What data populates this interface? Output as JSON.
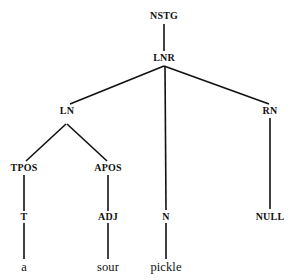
{
  "figure": {
    "kind": "linguistic-parse-tree",
    "sentence": "a sour pickle",
    "background_color": "#ffffff",
    "line_color": "#111111",
    "text_color": "#111111"
  },
  "nodes": [
    {
      "id": "nstg",
      "label": "NSTG",
      "kind": "category",
      "x": 164,
      "y": 16
    },
    {
      "id": "lnr",
      "label": "LNR",
      "kind": "category",
      "x": 164,
      "y": 58
    },
    {
      "id": "ln",
      "label": "LN",
      "kind": "category",
      "x": 67,
      "y": 111
    },
    {
      "id": "rn",
      "label": "RN",
      "kind": "category",
      "x": 270,
      "y": 111
    },
    {
      "id": "tpos",
      "label": "TPOS",
      "kind": "category",
      "x": 24,
      "y": 168
    },
    {
      "id": "apos",
      "label": "APOS",
      "kind": "category",
      "x": 108,
      "y": 168
    },
    {
      "id": "t",
      "label": "T",
      "kind": "category",
      "x": 24,
      "y": 217
    },
    {
      "id": "adj",
      "label": "ADJ",
      "kind": "category",
      "x": 108,
      "y": 217
    },
    {
      "id": "n",
      "label": "N",
      "kind": "category",
      "x": 166,
      "y": 217
    },
    {
      "id": "null",
      "label": "NULL",
      "kind": "category",
      "x": 270,
      "y": 217
    },
    {
      "id": "word_a",
      "label": "a",
      "kind": "word",
      "x": 24,
      "y": 267
    },
    {
      "id": "word_sour",
      "label": "sour",
      "kind": "word",
      "x": 108,
      "y": 267
    },
    {
      "id": "word_pickle",
      "label": "pickle",
      "kind": "word",
      "x": 166,
      "y": 267
    }
  ],
  "edges": [
    {
      "id": "edge-nstg-lnr",
      "from": "nstg",
      "to": "lnr",
      "x1": 164,
      "y1": 24,
      "x2": 164,
      "y2": 51
    },
    {
      "id": "edge-lnr-ln",
      "from": "lnr",
      "to": "ln",
      "x1": 164,
      "y1": 66,
      "x2": 70,
      "y2": 104
    },
    {
      "id": "edge-lnr-n",
      "from": "lnr",
      "to": "n",
      "x1": 165,
      "y1": 66,
      "x2": 166,
      "y2": 210
    },
    {
      "id": "edge-lnr-rn",
      "from": "lnr",
      "to": "rn",
      "x1": 164,
      "y1": 66,
      "x2": 269,
      "y2": 104
    },
    {
      "id": "edge-ln-tpos",
      "from": "ln",
      "to": "tpos",
      "x1": 66,
      "y1": 124,
      "x2": 26,
      "y2": 161
    },
    {
      "id": "edge-ln-apos",
      "from": "ln",
      "to": "apos",
      "x1": 67,
      "y1": 124,
      "x2": 107,
      "y2": 161
    },
    {
      "id": "edge-rn-null",
      "from": "rn",
      "to": "null",
      "x1": 270,
      "y1": 118,
      "x2": 270,
      "y2": 209
    },
    {
      "id": "edge-tpos-t",
      "from": "tpos",
      "to": "t",
      "x1": 24,
      "y1": 175,
      "x2": 24,
      "y2": 211
    },
    {
      "id": "edge-apos-adj",
      "from": "apos",
      "to": "adj",
      "x1": 108,
      "y1": 175,
      "x2": 108,
      "y2": 211
    },
    {
      "id": "edge-t-a",
      "from": "t",
      "to": "word_a",
      "x1": 24,
      "y1": 223,
      "x2": 24,
      "y2": 259
    },
    {
      "id": "edge-adj-sour",
      "from": "adj",
      "to": "word_sour",
      "x1": 108,
      "y1": 223,
      "x2": 108,
      "y2": 259
    },
    {
      "id": "edge-n-pickle",
      "from": "n",
      "to": "word_pickle",
      "x1": 166,
      "y1": 223,
      "x2": 166,
      "y2": 259
    }
  ]
}
